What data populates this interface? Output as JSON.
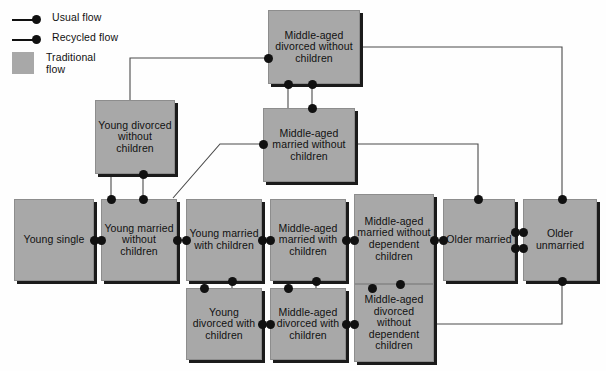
{
  "legend": {
    "items": [
      {
        "label": "Usual flow",
        "marker": "line-dot"
      },
      {
        "label": "Recycled flow",
        "marker": "line-dot"
      },
      {
        "label": "Traditional flow",
        "marker": "swatch",
        "color": "#a8a8a8"
      }
    ]
  },
  "colors": {
    "box_fill": "#a8a8a8",
    "box_shadow": "#1b1b1b",
    "line": "#4a4a4a",
    "dot": "#111111",
    "text": "#111111",
    "background": "#ffffff"
  },
  "nodes": [
    {
      "id": "mad_wo_ch",
      "label": "Middle-aged divorced without children",
      "x": 268,
      "y": 10,
      "w": 92,
      "h": 74
    },
    {
      "id": "yd_wo_ch",
      "label": "Young divorced without children",
      "x": 95,
      "y": 100,
      "w": 80,
      "h": 74
    },
    {
      "id": "mam_wo_ch",
      "label": "Middle-aged married without children",
      "x": 263,
      "y": 108,
      "w": 92,
      "h": 74
    },
    {
      "id": "y_single",
      "label": "Young single",
      "x": 14,
      "y": 199,
      "w": 80,
      "h": 82
    },
    {
      "id": "ym_wo_ch",
      "label": "Young married without children",
      "x": 101,
      "y": 199,
      "w": 76,
      "h": 82
    },
    {
      "id": "ym_w_ch",
      "label": "Young married with children",
      "x": 186,
      "y": 199,
      "w": 76,
      "h": 82
    },
    {
      "id": "mam_w_ch",
      "label": "Middle-aged married with children",
      "x": 270,
      "y": 199,
      "w": 76,
      "h": 82
    },
    {
      "id": "mam_wo_dep",
      "label": "Middle-aged married without dependent children",
      "x": 354,
      "y": 194,
      "w": 80,
      "h": 90
    },
    {
      "id": "o_married",
      "label": "Older married",
      "x": 443,
      "y": 199,
      "w": 72,
      "h": 82
    },
    {
      "id": "o_unmar",
      "label": "Older unmarried",
      "x": 523,
      "y": 199,
      "w": 74,
      "h": 82
    },
    {
      "id": "yd_w_ch",
      "label": "Young divorced with children",
      "x": 186,
      "y": 288,
      "w": 76,
      "h": 72
    },
    {
      "id": "mad_w_ch",
      "label": "Middle-aged divorced with children",
      "x": 270,
      "y": 288,
      "w": 76,
      "h": 72
    },
    {
      "id": "mad_wo_dep",
      "label": "Middle-aged divorced without dependent children",
      "x": 354,
      "y": 284,
      "w": 80,
      "h": 78
    }
  ],
  "edges": [
    {
      "from": "mad_wo_ch",
      "to": "yd_wo_ch",
      "type": "usual"
    },
    {
      "from": "mad_wo_ch",
      "to": "mam_wo_ch",
      "type": "recycled"
    },
    {
      "from": "mad_wo_ch",
      "to": "o_unmar",
      "type": "usual"
    },
    {
      "from": "mam_wo_ch",
      "to": "mad_wo_ch",
      "type": "recycled"
    },
    {
      "from": "mam_wo_ch",
      "to": "ym_wo_ch",
      "type": "recycled"
    },
    {
      "from": "mam_wo_ch",
      "to": "o_married",
      "type": "usual"
    },
    {
      "from": "yd_wo_ch",
      "to": "ym_wo_ch",
      "type": "recycled"
    },
    {
      "from": "y_single",
      "to": "ym_wo_ch",
      "type": "usual"
    },
    {
      "from": "ym_wo_ch",
      "to": "ym_w_ch",
      "type": "usual"
    },
    {
      "from": "ym_w_ch",
      "to": "mam_w_ch",
      "type": "usual"
    },
    {
      "from": "mam_w_ch",
      "to": "mam_wo_dep",
      "type": "usual"
    },
    {
      "from": "mam_wo_dep",
      "to": "o_married",
      "type": "usual"
    },
    {
      "from": "o_married",
      "to": "o_unmar",
      "type": "usual"
    },
    {
      "from": "ym_w_ch",
      "to": "yd_w_ch",
      "type": "recycled"
    },
    {
      "from": "mam_w_ch",
      "to": "mad_w_ch",
      "type": "recycled"
    },
    {
      "from": "mam_wo_dep",
      "to": "mad_wo_dep",
      "type": "recycled"
    },
    {
      "from": "yd_w_ch",
      "to": "mad_w_ch",
      "type": "usual"
    },
    {
      "from": "mad_w_ch",
      "to": "mad_wo_dep",
      "type": "usual"
    },
    {
      "from": "mad_wo_dep",
      "to": "o_unmar",
      "type": "usual"
    }
  ]
}
